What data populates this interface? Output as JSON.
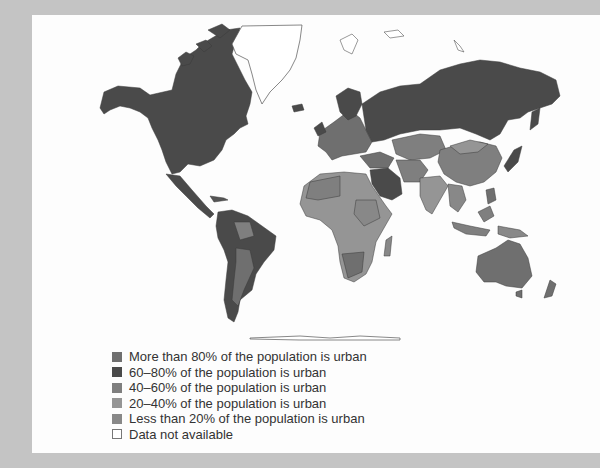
{
  "map": {
    "title": "Percentage of population that is urban, by country",
    "regions": {
      "north_america": {
        "category": 1
      },
      "greenland": {
        "category": 5
      },
      "europe_west": {
        "category": 0
      },
      "russia": {
        "category": 1
      },
      "china": {
        "category": 2
      },
      "mongolia": {
        "category": 3
      },
      "south_america": {
        "category": 1
      },
      "africa": {
        "category": 3
      },
      "middle_east": {
        "category": 1
      },
      "india": {
        "category": 3
      },
      "southeast_asia": {
        "category": 3
      },
      "australia": {
        "category": 0
      },
      "japan": {
        "category": 1
      },
      "antarctica": {
        "category": 5
      }
    }
  },
  "legend": {
    "items": [
      {
        "label": "More than 80% of the population is urban",
        "color": "#6f6f6f"
      },
      {
        "label": "60–80% of the population is urban",
        "color": "#4a4a4a"
      },
      {
        "label": "40–60% of the population is urban",
        "color": "#7f7f7f"
      },
      {
        "label": "20–40% of the population is urban",
        "color": "#959595"
      },
      {
        "label": "Less than 20% of the population is urban",
        "color": "#888888"
      },
      {
        "label": "Data not available",
        "color": "#ffffff"
      }
    ]
  },
  "colors": {
    "background": "#c4c4c4",
    "panel": "#fdfdfd",
    "outline": "#3c3c3c"
  }
}
